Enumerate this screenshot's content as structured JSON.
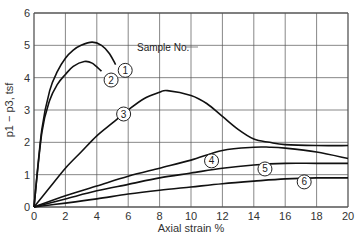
{
  "chart_data": {
    "type": "line",
    "title": "",
    "xlabel": "Axial strain %",
    "ylabel": "p1 − p3, tsf",
    "xlim": [
      0,
      20
    ],
    "ylim": [
      0,
      6
    ],
    "xticks": [
      0,
      2,
      4,
      6,
      8,
      10,
      12,
      14,
      16,
      18,
      20
    ],
    "yticks": [
      0,
      1,
      2,
      3,
      4,
      5,
      6
    ],
    "grid": true,
    "annotation": "Sample No.",
    "series": [
      {
        "name": "1",
        "x": [
          0,
          0.5,
          1,
          1.5,
          2,
          2.5,
          3,
          3.7,
          4.3,
          4.8,
          5.2
        ],
        "y": [
          0,
          2.4,
          3.6,
          4.2,
          4.6,
          4.85,
          5.0,
          5.1,
          5.0,
          4.75,
          4.4
        ]
      },
      {
        "name": "2",
        "x": [
          0,
          0.5,
          1,
          1.5,
          2,
          2.5,
          3.2,
          3.7,
          4.3
        ],
        "y": [
          0,
          2.3,
          3.3,
          3.8,
          4.1,
          4.35,
          4.5,
          4.45,
          4.2
        ]
      },
      {
        "name": "3",
        "x": [
          0,
          1,
          2,
          3,
          4,
          5,
          6,
          7,
          8,
          8.5,
          10,
          11,
          12,
          13,
          14,
          15,
          16,
          18,
          20
        ],
        "y": [
          0,
          0.6,
          1.2,
          1.7,
          2.2,
          2.6,
          3.0,
          3.35,
          3.55,
          3.6,
          3.45,
          3.2,
          2.8,
          2.4,
          2.1,
          2.0,
          1.93,
          1.9,
          1.9
        ]
      },
      {
        "name": "4",
        "x": [
          0,
          2,
          4,
          6,
          8,
          10,
          12,
          14,
          15,
          16,
          18,
          20
        ],
        "y": [
          0,
          0.35,
          0.65,
          0.95,
          1.2,
          1.45,
          1.75,
          1.85,
          1.85,
          1.82,
          1.7,
          1.5
        ]
      },
      {
        "name": "5",
        "x": [
          0,
          2,
          4,
          6,
          8,
          10,
          12,
          14,
          16,
          18,
          20
        ],
        "y": [
          0,
          0.25,
          0.5,
          0.7,
          0.9,
          1.05,
          1.2,
          1.3,
          1.35,
          1.35,
          1.35
        ]
      },
      {
        "name": "6",
        "x": [
          0,
          2,
          4,
          6,
          8,
          10,
          12,
          14,
          16,
          18,
          20
        ],
        "y": [
          0,
          0.12,
          0.25,
          0.4,
          0.52,
          0.62,
          0.72,
          0.8,
          0.87,
          0.9,
          0.9
        ]
      }
    ],
    "labels": [
      {
        "text": "1",
        "x": 5.3,
        "y": 4.35
      },
      {
        "text": "2",
        "x": 4.4,
        "y": 4.05
      },
      {
        "text": "3",
        "x": 5.2,
        "y": 3.0
      },
      {
        "text": "4",
        "x": 10.8,
        "y": 1.55
      },
      {
        "text": "5",
        "x": 14.2,
        "y": 1.3
      },
      {
        "text": "6",
        "x": 16.7,
        "y": 0.9
      }
    ]
  }
}
